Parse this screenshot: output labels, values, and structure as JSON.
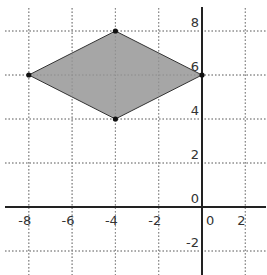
{
  "chart_data": {
    "type": "polygon",
    "title": "",
    "xlabel": "",
    "ylabel": "",
    "xlim": [
      -8.6,
      2.5
    ],
    "ylim": [
      -2.7,
      8.8
    ],
    "grid": true,
    "grid_style": "dotted",
    "x_ticks": [
      -8,
      -6,
      -4,
      -2,
      0,
      2
    ],
    "y_ticks": [
      8,
      6,
      4,
      2,
      0,
      -2
    ],
    "x_tick_labels": [
      "-8",
      "-6",
      "-4",
      "-2",
      "0",
      "2"
    ],
    "y_tick_labels": [
      "8",
      "6",
      "4",
      "2",
      "0",
      "-2"
    ],
    "polygon": {
      "name": "rhombus",
      "vertices": [
        [
          -8,
          6
        ],
        [
          -4,
          8
        ],
        [
          0,
          6
        ],
        [
          -4,
          4
        ]
      ],
      "fill": "#a6a6a6",
      "stroke": "#333333"
    },
    "points": [
      {
        "x": -8,
        "y": 6
      },
      {
        "x": -4,
        "y": 8
      },
      {
        "x": 0,
        "y": 6
      },
      {
        "x": -4,
        "y": 4
      }
    ]
  },
  "colors": {
    "axis": "#222222",
    "grid": "#888888",
    "fill": "#a6a6a6",
    "point": "#111111"
  }
}
